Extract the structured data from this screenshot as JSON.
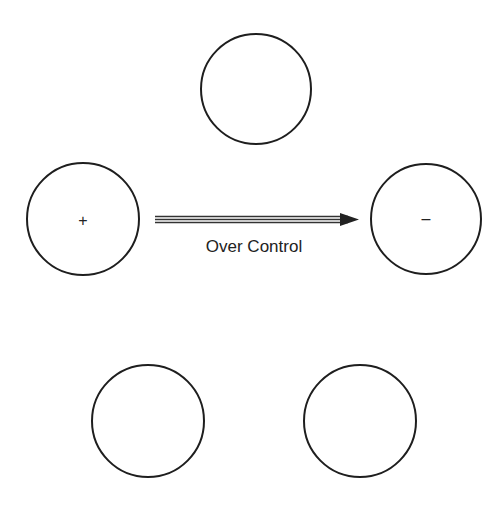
{
  "diagram": {
    "nodes": [
      {
        "id": "top",
        "cx": 256,
        "cy": 89,
        "r": 55,
        "sign": ""
      },
      {
        "id": "left",
        "cx": 83,
        "cy": 219,
        "r": 56,
        "sign": "+"
      },
      {
        "id": "right",
        "cx": 426,
        "cy": 219,
        "r": 55,
        "sign": "–"
      },
      {
        "id": "bottom-left",
        "cx": 148,
        "cy": 421,
        "r": 56,
        "sign": ""
      },
      {
        "id": "bottom-right",
        "cx": 360,
        "cy": 421,
        "r": 56,
        "sign": ""
      }
    ],
    "edge": {
      "from": "left",
      "to": "right",
      "style": "double-line-arrow",
      "label": "Over Control"
    },
    "stroke_color": "#1e1e1e"
  }
}
